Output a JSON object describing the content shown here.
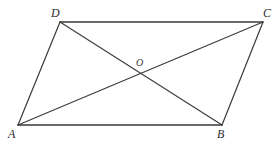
{
  "figure": {
    "background_color": "#ffffff",
    "stroke_color": "#3a3a3a",
    "stroke_width": 1.2,
    "width": 279,
    "height": 147,
    "labels": {
      "A": "A",
      "B": "B",
      "C": "C",
      "D": "D",
      "O": "O"
    },
    "vertices": [
      {
        "name": "A",
        "x": 18,
        "y": 125
      },
      {
        "name": "B",
        "x": 222,
        "y": 125
      },
      {
        "name": "C",
        "x": 263,
        "y": 22
      },
      {
        "name": "D",
        "x": 60,
        "y": 22
      }
    ],
    "intersection": {
      "name": "O",
      "x": 141,
      "y": 74
    },
    "sides": [
      {
        "name": "AB",
        "from": "A",
        "to": "B"
      },
      {
        "name": "BC",
        "from": "B",
        "to": "C"
      },
      {
        "name": "CD",
        "from": "C",
        "to": "D"
      },
      {
        "name": "DA",
        "from": "D",
        "to": "A"
      }
    ],
    "diagonals": [
      {
        "name": "AC",
        "from": "A",
        "to": "C"
      },
      {
        "name": "DB",
        "from": "D",
        "to": "B"
      }
    ]
  }
}
